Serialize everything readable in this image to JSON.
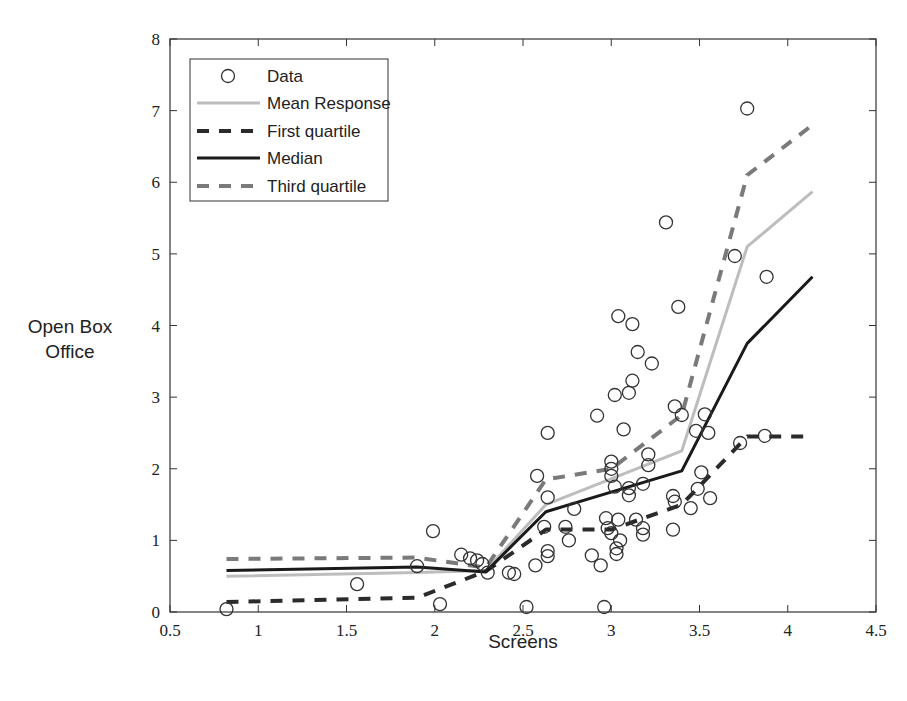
{
  "chart_data": {
    "type": "line",
    "title": "",
    "xlabel": "Screens",
    "ylabel": "Open Box Office",
    "xlim": [
      0.5,
      4.5
    ],
    "ylim": [
      0,
      8
    ],
    "xticks": [
      0.5,
      1,
      1.5,
      2,
      2.5,
      3,
      3.5,
      4,
      4.5
    ],
    "xtick_labels": [
      "0.5",
      "1",
      "1.5",
      "2",
      "2.5",
      "3",
      "3.5",
      "4",
      "4.5"
    ],
    "yticks": [
      0,
      1,
      2,
      3,
      4,
      5,
      6,
      7,
      8
    ],
    "ytick_labels": [
      "0",
      "1",
      "2",
      "3",
      "4",
      "5",
      "6",
      "7",
      "8"
    ],
    "grid": false,
    "legend_position": "upper left",
    "legend": [
      "Data",
      "Mean Response",
      "First quartile",
      "Median",
      "Third quartile"
    ],
    "series": [
      {
        "name": "Mean Response",
        "style": "solid",
        "color": "#bdbdbd",
        "x": [
          0.82,
          1.9,
          2.29,
          2.63,
          3.4,
          3.77,
          4.14
        ],
        "y": [
          0.5,
          0.55,
          0.58,
          1.5,
          2.25,
          5.1,
          5.87
        ]
      },
      {
        "name": "First quartile",
        "style": "dashed",
        "color": "#2b2b2b",
        "x": [
          0.82,
          1.9,
          2.29,
          2.63,
          3.0,
          3.4,
          3.77,
          4.14
        ],
        "y": [
          0.14,
          0.2,
          0.57,
          1.15,
          1.15,
          1.5,
          2.45,
          2.45
        ]
      },
      {
        "name": "Median",
        "style": "solid",
        "color": "#1a1a1a",
        "x": [
          0.82,
          1.9,
          2.29,
          2.63,
          3.4,
          3.77,
          4.14
        ],
        "y": [
          0.58,
          0.63,
          0.56,
          1.4,
          1.97,
          3.75,
          4.68
        ]
      },
      {
        "name": "Third quartile",
        "style": "dashed",
        "color": "#7a7a7a",
        "x": [
          0.82,
          1.9,
          2.29,
          2.63,
          3.0,
          3.4,
          3.77,
          4.14
        ],
        "y": [
          0.74,
          0.76,
          0.62,
          1.85,
          2.0,
          2.75,
          6.1,
          6.8
        ]
      }
    ],
    "scatter": {
      "name": "Data",
      "marker": "open-circle",
      "color": "#333333",
      "points": [
        [
          0.82,
          0.04
        ],
        [
          1.56,
          0.39
        ],
        [
          1.9,
          0.64
        ],
        [
          1.99,
          1.13
        ],
        [
          2.03,
          0.11
        ],
        [
          2.15,
          0.8
        ],
        [
          2.2,
          0.75
        ],
        [
          2.24,
          0.72
        ],
        [
          2.27,
          0.67
        ],
        [
          2.3,
          0.55
        ],
        [
          2.42,
          0.55
        ],
        [
          2.45,
          0.53
        ],
        [
          2.52,
          0.07
        ],
        [
          2.57,
          0.65
        ],
        [
          2.58,
          1.9
        ],
        [
          2.62,
          1.19
        ],
        [
          2.64,
          0.85
        ],
        [
          2.64,
          0.78
        ],
        [
          2.64,
          1.6
        ],
        [
          2.64,
          2.5
        ],
        [
          2.74,
          1.19
        ],
        [
          2.76,
          1.0
        ],
        [
          2.79,
          1.44
        ],
        [
          2.89,
          0.79
        ],
        [
          2.92,
          2.74
        ],
        [
          2.94,
          0.65
        ],
        [
          2.96,
          0.07
        ],
        [
          2.97,
          1.31
        ],
        [
          2.98,
          1.17
        ],
        [
          3.0,
          1.1
        ],
        [
          3.0,
          2.1
        ],
        [
          3.0,
          2.0
        ],
        [
          3.0,
          1.9
        ],
        [
          3.02,
          1.75
        ],
        [
          3.02,
          3.03
        ],
        [
          3.03,
          0.89
        ],
        [
          3.03,
          0.81
        ],
        [
          3.04,
          1.29
        ],
        [
          3.04,
          4.13
        ],
        [
          3.05,
          1.0
        ],
        [
          3.07,
          2.55
        ],
        [
          3.1,
          1.73
        ],
        [
          3.1,
          1.63
        ],
        [
          3.1,
          3.06
        ],
        [
          3.12,
          3.23
        ],
        [
          3.12,
          4.02
        ],
        [
          3.14,
          1.29
        ],
        [
          3.15,
          3.63
        ],
        [
          3.18,
          1.17
        ],
        [
          3.18,
          1.79
        ],
        [
          3.18,
          1.08
        ],
        [
          3.21,
          2.2
        ],
        [
          3.21,
          2.05
        ],
        [
          3.23,
          3.47
        ],
        [
          3.31,
          5.44
        ],
        [
          3.35,
          1.62
        ],
        [
          3.35,
          1.15
        ],
        [
          3.36,
          1.54
        ],
        [
          3.36,
          2.87
        ],
        [
          3.38,
          4.26
        ],
        [
          3.4,
          2.75
        ],
        [
          3.45,
          1.45
        ],
        [
          3.48,
          2.53
        ],
        [
          3.49,
          1.72
        ],
        [
          3.51,
          1.95
        ],
        [
          3.53,
          2.76
        ],
        [
          3.55,
          2.5
        ],
        [
          3.56,
          1.59
        ],
        [
          3.7,
          4.97
        ],
        [
          3.73,
          2.36
        ],
        [
          3.77,
          7.03
        ],
        [
          3.87,
          2.46
        ],
        [
          3.88,
          4.68
        ]
      ]
    }
  }
}
